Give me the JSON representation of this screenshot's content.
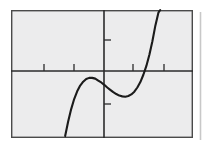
{
  "figure": {
    "title": "",
    "caption": "",
    "background_color": "#ffffff",
    "panel_color": "#ececed",
    "frame_color": "#4a4a4a",
    "axis_color": "#2b2b2b",
    "curve_color": "#1b1b1b",
    "side_rule_color": "#c8c8c8"
  },
  "chart_data": {
    "type": "line",
    "title": "",
    "subtitle": "",
    "xlabel": "",
    "ylabel": "",
    "grid": false,
    "legend": null,
    "legend_position": "none",
    "annotations": [],
    "xlim": [
      -3.1,
      2.95
    ],
    "ylim": [
      -2.25,
      1.07
    ],
    "xticks": [
      -2,
      -1,
      1,
      2
    ],
    "xticklabels": [
      "",
      "",
      "",
      ""
    ],
    "yticks": [
      0.52,
      -0.55
    ],
    "yticklabels": [
      "",
      ""
    ],
    "series": [
      {
        "name": "cubic curve",
        "description": "cubic polynomial with local maximum left of the y-axis below the x-axis, local minimum right of the y-axis, rising steeply to exit the top of the frame",
        "x": [
          -1.3,
          -1.2,
          -1.1,
          -1.0,
          -0.9,
          -0.8,
          -0.7,
          -0.6,
          -0.5,
          -0.4,
          -0.3,
          -0.2,
          -0.1,
          0.0,
          0.1,
          0.2,
          0.3,
          0.4,
          0.5,
          0.6,
          0.7,
          0.8,
          0.9,
          1.0,
          1.1,
          1.2,
          1.3,
          1.4,
          1.5,
          1.6,
          1.7,
          1.8,
          1.86
        ],
        "y": [
          -2.2,
          -1.82,
          -1.5,
          -1.24,
          -1.04,
          -0.89,
          -0.79,
          -0.72,
          -0.69,
          -0.69,
          -0.71,
          -0.76,
          -0.81,
          -0.87,
          -0.94,
          -1.0,
          -1.06,
          -1.11,
          -1.15,
          -1.17,
          -1.18,
          -1.16,
          -1.12,
          -1.05,
          -0.94,
          -0.8,
          -0.61,
          -0.38,
          -0.09,
          0.26,
          0.67,
          1.0,
          1.07
        ],
        "local_maximum": [
          -0.45,
          -0.68
        ],
        "local_minimum": [
          0.7,
          -1.18
        ],
        "y_intercept": [
          0.0,
          -0.87
        ],
        "x_intercept": [
          1.53,
          0.0
        ],
        "enters_frame_bottom_at_x": -1.3,
        "exits_frame_top_at_x": 1.86
      }
    ]
  },
  "geometry": {
    "frame": {
      "left": 11,
      "top": 10,
      "right": 193,
      "bottom": 138
    },
    "x_axis_y": 71,
    "y_axis_x": 104,
    "x_tick_pixels": [
      44,
      74,
      133,
      164
    ],
    "y_tick_pixels": [
      40,
      104
    ],
    "side_rule_x": 200
  }
}
